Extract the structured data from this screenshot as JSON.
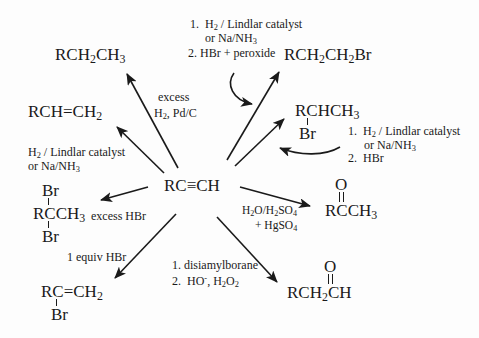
{
  "diagram": {
    "center": {
      "label_prefix": "RC",
      "triple_bond": "≡",
      "label_suffix": "CH"
    },
    "products": {
      "alkane": {
        "parts": [
          "RCH",
          "2",
          "CH",
          "3"
        ]
      },
      "alkene": {
        "parts": [
          "RCH",
          "=",
          "CH",
          "2"
        ]
      },
      "anti_markovnikov_bromide": {
        "parts": [
          "RCH",
          "2",
          "CH",
          "2",
          "Br"
        ]
      },
      "markovnikov_bromide": {
        "main": [
          "RCHCH",
          "3"
        ],
        "substituent": "Br"
      },
      "geminal_dibromide": {
        "top": "Br",
        "main": [
          "RCCH",
          "3"
        ],
        "bottom": "Br"
      },
      "vinyl_bromide": {
        "main": [
          "RC",
          "=",
          "CH",
          "2"
        ],
        "substituent": "Br"
      },
      "methyl_ketone": {
        "top": "O",
        "main": [
          "RCCH",
          "3"
        ]
      },
      "aldehyde": {
        "top": "O",
        "main": [
          "RCH",
          "2",
          "CH"
        ]
      }
    },
    "reagents": {
      "excess_h2": {
        "line1": "excess",
        "line2_a": "H",
        "line2_sub": "2",
        "line2_b": ", Pd/C"
      },
      "lindlar": {
        "line1_a": "H",
        "line1_sub": "2",
        "line1_b": " / Lindlar catalyst",
        "line2_a": "or Na/NH",
        "line2_sub": "3"
      },
      "top_steps": {
        "step1_num": "1.",
        "step1_a": "H",
        "step1_sub": "2",
        "step1_b": " / Lindlar catalyst",
        "step1_cont_a": "or Na/NH",
        "step1_cont_sub": "3",
        "step2_num": "2.",
        "step2": "HBr + peroxide"
      },
      "right_steps": {
        "step1_num": "1.",
        "step1_a": "H",
        "step1_sub": "2",
        "step1_b": " / Lindlar catalyst",
        "step1_cont_a": "or Na/NH",
        "step1_cont_sub": "3",
        "step2_num": "2.",
        "step2": "HBr"
      },
      "excess_hbr": "excess HBr",
      "one_equiv_hbr": "1 equiv HBr",
      "hydration": {
        "line1_a": "H",
        "line1_s1": "2",
        "line1_b": "O/H",
        "line1_s2": "2",
        "line1_c": "SO",
        "line1_s3": "4",
        "line2_a": "+  HgSO",
        "line2_sub": "4"
      },
      "hydroboration": {
        "step1": "1. disiamylborane",
        "step2_num": "2.",
        "step2_a": "HO",
        "step2_sup": "-",
        "step2_b": ", H",
        "step2_s1": "2",
        "step2_c": "O",
        "step2_s2": "2"
      }
    },
    "colors": {
      "ink": "#1a1a1a",
      "background": "#fdfdfd"
    }
  }
}
